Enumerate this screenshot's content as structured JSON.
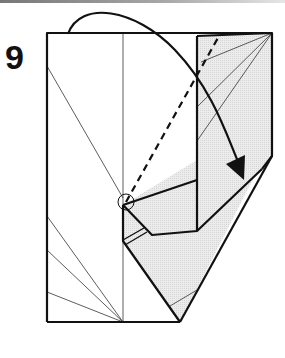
{
  "step": {
    "number": "9"
  },
  "diagram": {
    "colors": {
      "line": "#111111",
      "thin_line": "#333333",
      "shade": "#e6e6e6",
      "paper": "#ffffff"
    },
    "markers": {
      "fold_line": "dashed valley fold",
      "arrow": "curved fold arrow with filled head",
      "reference_point": "circle"
    }
  }
}
